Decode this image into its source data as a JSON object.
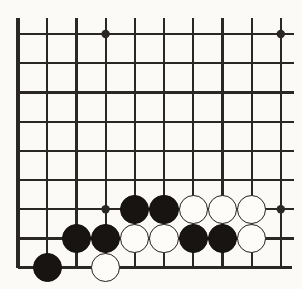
{
  "figure": {
    "name": "go-board-diagram",
    "board_region": "bottom-left corner",
    "width": 302,
    "height": 289
  },
  "board": {
    "background_color": "#fbfaf6",
    "line_color": "#2b2724",
    "line_width": 2.2,
    "edge_line_width": 3.2,
    "grid_origin_x": 18,
    "grid_origin_y": 34,
    "grid_spacing": 29.2,
    "columns": 10,
    "rows": 9,
    "left_edge_index": 0,
    "bottom_edge_index": 8,
    "open_right": true,
    "open_top": true,
    "stone_radius": 14.6,
    "star_point_radius": 4.2,
    "star_points": [
      {
        "col": 3,
        "row": 0
      },
      {
        "col": 3,
        "row": 6
      },
      {
        "col": 9,
        "row": 0
      },
      {
        "col": 9,
        "row": 6
      }
    ]
  },
  "stones": {
    "black_color": "#181412",
    "white_color": "#fdfcf8",
    "white_outline_color": "#23201c",
    "black_count": 9,
    "white_count": 8,
    "list": [
      {
        "col": 4,
        "row": 6,
        "color": "black"
      },
      {
        "col": 5,
        "row": 6,
        "color": "black"
      },
      {
        "col": 6,
        "row": 6,
        "color": "white"
      },
      {
        "col": 7,
        "row": 6,
        "color": "white"
      },
      {
        "col": 8,
        "row": 6,
        "color": "white"
      },
      {
        "col": 2,
        "row": 7,
        "color": "black"
      },
      {
        "col": 3,
        "row": 7,
        "color": "black"
      },
      {
        "col": 4,
        "row": 7,
        "color": "white"
      },
      {
        "col": 5,
        "row": 7,
        "color": "white"
      },
      {
        "col": 6,
        "row": 7,
        "color": "black"
      },
      {
        "col": 7,
        "row": 7,
        "color": "black"
      },
      {
        "col": 8,
        "row": 7,
        "color": "white"
      },
      {
        "col": 1,
        "row": 8,
        "color": "black"
      },
      {
        "col": 3,
        "row": 8,
        "color": "white"
      }
    ]
  }
}
